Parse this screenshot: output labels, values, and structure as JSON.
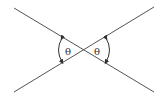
{
  "diagram": {
    "colors": {
      "line": "#555555",
      "arrow": "#333333",
      "background": "#ffffff"
    },
    "lines": [
      {
        "name": "line-descending",
        "from": [
          14,
          8
        ],
        "to": [
          154,
          92
        ]
      },
      {
        "name": "line-ascending",
        "from": [
          14,
          92
        ],
        "to": [
          154,
          7
        ]
      }
    ],
    "intersection": [
      84,
      50
    ],
    "angles": [
      {
        "name": "left-angle",
        "label": "θ",
        "label_pos": [
          68,
          55
        ]
      },
      {
        "name": "right-angle",
        "label": "θ",
        "label_pos": [
          97,
          55
        ]
      }
    ]
  }
}
